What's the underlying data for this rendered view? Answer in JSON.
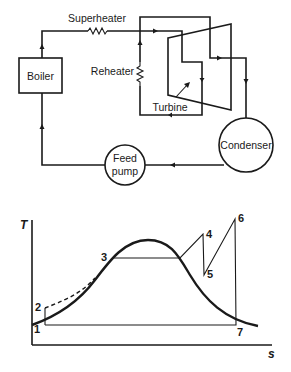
{
  "schematic": {
    "title": "Rankine cycle with superheat and reheat",
    "components": {
      "boiler": "Boiler",
      "superheater": "Superheater",
      "reheater": "Reheater",
      "turbine": "Turbine",
      "condenser": "Condenser",
      "feed_pump_line1": "Feed",
      "feed_pump_line2": "pump"
    },
    "flow": [
      "Feed pump",
      "Boiler",
      "Superheater",
      "Turbine (HP)",
      "Reheater",
      "Turbine (LP)",
      "Condenser",
      "Feed pump"
    ]
  },
  "ts_diagram": {
    "y_axis_label": "T",
    "x_axis_label": "s",
    "state_points": [
      {
        "id": "1",
        "label": "1"
      },
      {
        "id": "2",
        "label": "2"
      },
      {
        "id": "3",
        "label": "3"
      },
      {
        "id": "4",
        "label": "4"
      },
      {
        "id": "5",
        "label": "5"
      },
      {
        "id": "6",
        "label": "6"
      },
      {
        "id": "7",
        "label": "7"
      }
    ],
    "process_path": "1-2 pump, 2-3 heating (dashed), 3-4 evaporation & superheat, 4-5 HP expansion, 5-6 reheat, 6-7 LP expansion, 7-1 condensation"
  }
}
